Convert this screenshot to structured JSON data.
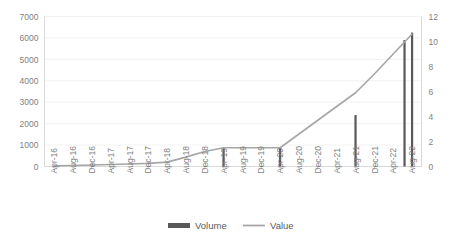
{
  "chart_data": {
    "type": "bar",
    "title": "",
    "xlabel": "",
    "ylabel": "",
    "y2label": "",
    "grid": true,
    "legend_position": "bottom",
    "categories": [
      "Apr-16",
      "Aug-16",
      "Dec-16",
      "Apr-17",
      "Aug-17",
      "Dec-17",
      "Apr-18",
      "Aug-18",
      "Dec-18",
      "Apr-19",
      "Aug-19",
      "Dec-19",
      "Apr-20",
      "Aug-20",
      "Dec-20",
      "Apr-21",
      "Aug-21",
      "Dec-21",
      "Apr-22",
      "Aug-22"
    ],
    "ylim": [
      0,
      7000
    ],
    "yticks": [
      0,
      1000,
      2000,
      3000,
      4000,
      5000,
      6000,
      7000
    ],
    "ylim2": [
      0,
      12
    ],
    "yticks2": [
      0,
      2,
      4,
      6,
      8,
      10,
      12
    ],
    "series": [
      {
        "name": "Volume",
        "type": "bar",
        "axis": "left",
        "color": "#595959",
        "values": [
          0,
          0,
          0,
          0,
          0,
          0,
          0,
          0,
          0,
          850,
          0,
          0,
          900,
          0,
          0,
          0,
          2400,
          0,
          0,
          6250
        ]
      },
      {
        "name": "Value",
        "type": "line",
        "axis": "right",
        "color": "#a6a6a6",
        "values": [
          0.05,
          0.08,
          0.12,
          0.16,
          0.2,
          0.25,
          0.35,
          0.75,
          1.2,
          1.5,
          1.5,
          1.5,
          1.5,
          2.6,
          3.7,
          4.8,
          5.9,
          7.4,
          9.0,
          10.6
        ]
      }
    ],
    "extra_bars": [
      {
        "category_index": 18.6,
        "value": 5900,
        "axis": "left"
      }
    ]
  },
  "legend": {
    "items": [
      {
        "label": "Volume",
        "marker": "bar-swatch",
        "color": "#595959"
      },
      {
        "label": "Value",
        "marker": "line-swatch",
        "color": "#a6a6a6"
      }
    ]
  },
  "axes": {
    "left_tick_labels": [
      "7000",
      "6000",
      "5000",
      "4000",
      "3000",
      "2000",
      "1000",
      "0"
    ],
    "right_tick_labels": [
      "12",
      "10",
      "8",
      "6",
      "4",
      "2",
      "0"
    ],
    "x_tick_labels": [
      "Apr-16",
      "Aug-16",
      "Dec-16",
      "Apr-17",
      "Aug-17",
      "Dec-17",
      "Apr-18",
      "Aug-18",
      "Dec-18",
      "Apr-19",
      "Aug-19",
      "Dec-19",
      "Apr-20",
      "Aug-20",
      "Dec-20",
      "Apr-21",
      "Aug-21",
      "Dec-21",
      "Apr-22",
      "Aug-22"
    ]
  }
}
